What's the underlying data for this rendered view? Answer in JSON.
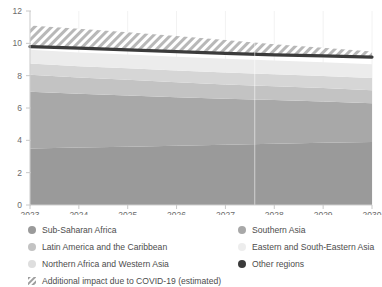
{
  "chart_data": {
    "type": "area",
    "title": "",
    "subtitle": "",
    "xlabel": "",
    "ylabel": "",
    "x": [
      2023,
      2024,
      2025,
      2026,
      2027,
      2028,
      2029,
      2030
    ],
    "xtick_labels": [
      "2023",
      "2024",
      "2025",
      "2026",
      "2027",
      "2028",
      "2029",
      "2030"
    ],
    "ytick_labels": [
      "0",
      "2",
      "4",
      "6",
      "8",
      "10",
      "12"
    ],
    "ytick_values": [
      0,
      2,
      4,
      6,
      8,
      10,
      12
    ],
    "ylim": [
      0,
      12
    ],
    "xlim": [
      2023,
      2030
    ],
    "grid": "vertical-faint",
    "legend_position": "below",
    "stacked": true,
    "series": [
      {
        "name": "Sub-Saharan Africa",
        "color": "#9a9a9a",
        "values": [
          3.5,
          3.55,
          3.61,
          3.67,
          3.73,
          3.79,
          3.85,
          3.9
        ]
      },
      {
        "name": "Southern Asia",
        "color": "#a8a8a8",
        "values": [
          3.5,
          3.33,
          3.17,
          3.0,
          2.84,
          2.7,
          2.55,
          2.4
        ]
      },
      {
        "name": "Latin America and the Caribbean",
        "color": "#c3c3c3",
        "values": [
          1.05,
          1.0,
          0.96,
          0.92,
          0.89,
          0.86,
          0.83,
          0.8
        ]
      },
      {
        "name": "Northern Africa and Western Asia",
        "color": "#d6d6d6",
        "values": [
          0.7,
          0.71,
          0.72,
          0.73,
          0.74,
          0.74,
          0.75,
          0.75
        ]
      },
      {
        "name": "Eastern and South-Eastern Asia",
        "color": "#ececec",
        "values": [
          0.85,
          0.85,
          0.85,
          0.85,
          0.85,
          0.85,
          0.85,
          0.85
        ]
      },
      {
        "name": "Other regions",
        "color": "#3b3b3b",
        "values": [
          0.2,
          0.19,
          0.18,
          0.17,
          0.16,
          0.15,
          0.15,
          0.15
        ]
      }
    ],
    "total_line": {
      "name": "Other regions",
      "color": "#3b3b3b",
      "values": [
        9.8,
        9.7,
        9.59,
        9.49,
        9.38,
        9.29,
        9.22,
        9.15
      ]
    },
    "hatched_band": {
      "name": "Additional impact due to COVID-19 (estimated)",
      "color": "#b5b5b5",
      "lower": [
        9.8,
        9.7,
        9.59,
        9.49,
        9.38,
        9.29,
        9.22,
        9.15
      ],
      "upper": [
        11.1,
        10.9,
        10.68,
        10.45,
        10.2,
        9.95,
        9.72,
        9.5
      ]
    }
  },
  "legend": {
    "columns": [
      {
        "items": [
          {
            "label": "Sub-Saharan Africa",
            "color": "#9a9a9a",
            "marker": "dot"
          },
          {
            "label": "Latin America and the Caribbean",
            "color": "#c3c3c3",
            "marker": "dot"
          },
          {
            "label": "Northern Africa and Western Asia",
            "color": "#dedede",
            "marker": "dot"
          },
          {
            "label": "Additional impact due to COVID-19 (estimated)",
            "color": "#b5b5b5",
            "marker": "hatch"
          }
        ]
      },
      {
        "items": [
          {
            "label": "Southern Asia",
            "color": "#a8a8a8",
            "marker": "dot"
          },
          {
            "label": "Eastern and South-Eastern Asia",
            "color": "#ededed",
            "marker": "dot"
          },
          {
            "label": "Other regions",
            "color": "#3b3b3b",
            "marker": "dot"
          }
        ]
      }
    ]
  },
  "axes": {
    "y_axis_color": "#cccccc",
    "x_axis_color": "#cccccc",
    "tick_color": "#bbbbbb",
    "label_color": "#6b6b6b"
  }
}
